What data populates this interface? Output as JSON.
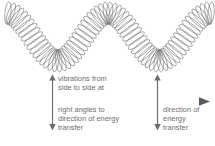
{
  "diagram": {
    "background_color": "#ffffff",
    "text_color": "#6e6e6e",
    "line_color": "#595959",
    "spring": {
      "icon": "coiled-spring-wave",
      "description": "coiled spring drawn as a transverse wave with crest and troughs",
      "coil_count": 72,
      "wave_cycles": 2
    },
    "labels": {
      "vibration_top": "vibrations from\nside to side at",
      "vibration_bottom": "right angles to\ndirection of energy\ntransfer",
      "energy_direction": "direction of\nenergy\ntransfer"
    },
    "arrows": {
      "vertical_left": "double-headed-vertical-arrow",
      "vertical_right": "double-headed-vertical-arrow",
      "horizontal": "right-pointing-arrow"
    }
  }
}
